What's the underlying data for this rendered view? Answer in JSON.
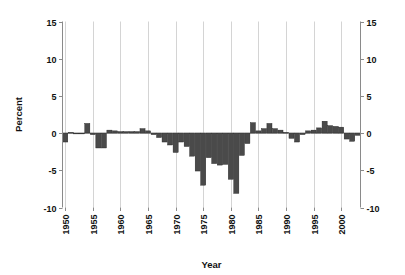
{
  "chart_data": {
    "type": "bar",
    "title": "",
    "subtitle": "",
    "xlabel": "Year",
    "ylabel": "Percent",
    "ylim": [
      -10,
      15
    ],
    "xlim": [
      1949.5,
      2003.5
    ],
    "grid": "vertical-only",
    "legend": "none",
    "bar_color": "#4a4a4a",
    "bar_edge_color": "#1d1d1d",
    "y_ticks": [
      15,
      10,
      5,
      0,
      -5,
      -10
    ],
    "y_tick_labels": [
      "15",
      "10",
      "5",
      "0",
      "-5",
      "-10"
    ],
    "y_axis_duplicated_right": true,
    "x_ticks": [
      1950,
      1955,
      1960,
      1965,
      1970,
      1975,
      1980,
      1985,
      1990,
      1995,
      2000
    ],
    "x_tick_labels": [
      "1950",
      "1955",
      "1960",
      "1965",
      "1970",
      "1975",
      "1980",
      "1985",
      "1990",
      "1995",
      "2000"
    ],
    "x_tick_label_rotation": 90,
    "categories": [
      1950,
      1951,
      1952,
      1953,
      1954,
      1955,
      1956,
      1957,
      1958,
      1959,
      1960,
      1961,
      1962,
      1963,
      1964,
      1965,
      1966,
      1967,
      1968,
      1969,
      1970,
      1971,
      1972,
      1973,
      1974,
      1975,
      1976,
      1977,
      1978,
      1979,
      1980,
      1981,
      1982,
      1983,
      1984,
      1985,
      1986,
      1987,
      1988,
      1989,
      1990,
      1991,
      1992,
      1993,
      1994,
      1995,
      1996,
      1997,
      1998,
      1999,
      2000,
      2001,
      2002,
      2003
    ],
    "values": [
      -1.2,
      0.1,
      0.0,
      0.0,
      1.3,
      -0.2,
      -2.0,
      -2.0,
      0.4,
      0.3,
      0.2,
      0.2,
      0.2,
      0.2,
      0.6,
      0.3,
      -0.2,
      -0.6,
      -1.2,
      -1.6,
      -2.6,
      -1.2,
      -1.8,
      -3.1,
      -5.1,
      -7.0,
      -3.3,
      -4.1,
      -4.3,
      -4.2,
      -6.2,
      -8.1,
      -3.0,
      -1.4,
      1.4,
      0.3,
      0.6,
      1.3,
      0.6,
      0.4,
      0.1,
      -0.7,
      -1.2,
      -0.2,
      0.3,
      0.4,
      0.7,
      1.6,
      1.0,
      0.9,
      0.8,
      -0.8,
      -1.1,
      -0.3
    ]
  }
}
